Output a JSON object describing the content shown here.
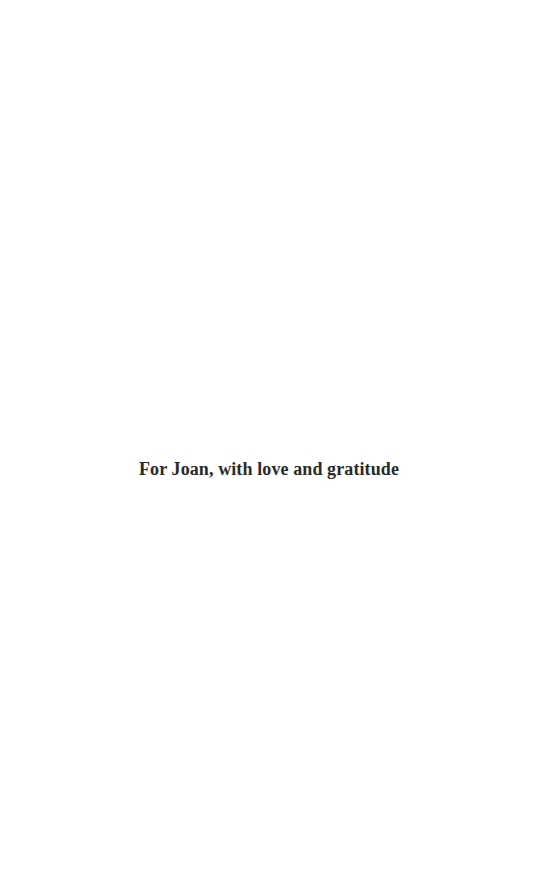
{
  "document": {
    "page_type": "dedication",
    "background_color": "#ffffff",
    "text_color": "#2a2a2a",
    "dedication": {
      "line": "For Joan, with love and gratitude"
    }
  }
}
